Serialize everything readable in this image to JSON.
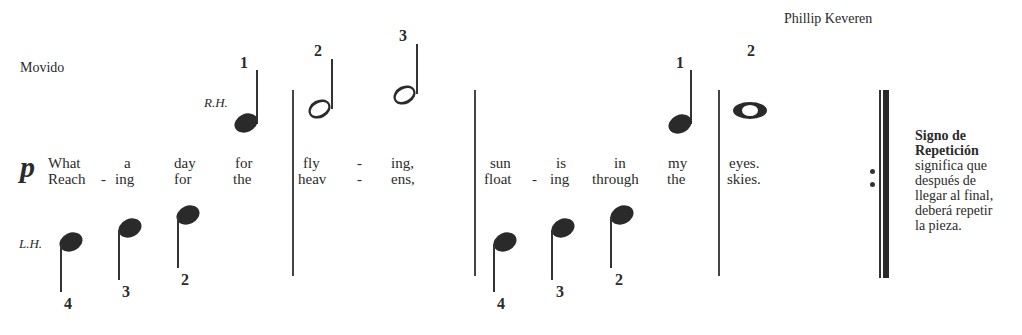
{
  "header": {
    "composer": "Phillip Keveren",
    "tempo": "Movido"
  },
  "hands": {
    "right": "R.H.",
    "left": "L.H."
  },
  "dynamic": "p",
  "lyrics": {
    "verse1": [
      "What",
      "a",
      "day",
      "for",
      "fly",
      "-",
      "ing,",
      "sun",
      "is",
      "in",
      "my",
      "eyes."
    ],
    "verse2": [
      "Reach",
      "-",
      "ing",
      "for",
      "the",
      "heav",
      "-",
      "ens,",
      "float",
      "-",
      "ing",
      "through",
      "the",
      "skies."
    ]
  },
  "right_hand_fingerings": [
    "1",
    "2",
    "3",
    "1",
    "2"
  ],
  "left_hand_fingerings": [
    "4",
    "3",
    "2",
    "4",
    "3",
    "2"
  ],
  "repeat_note": {
    "title_line1": "Signo de",
    "title_line2": "Repetición",
    "lines": [
      "significa que",
      "después de",
      "llegar al final,",
      "deberá repetir",
      "la pieza."
    ]
  }
}
